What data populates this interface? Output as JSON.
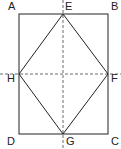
{
  "diagram": {
    "type": "geometry",
    "labels": {
      "A": "A",
      "B": "B",
      "C": "C",
      "D": "D",
      "E": "E",
      "F": "F",
      "G": "G",
      "H": "H"
    },
    "colors": {
      "stroke": "#222222",
      "background": "#ffffff"
    }
  }
}
